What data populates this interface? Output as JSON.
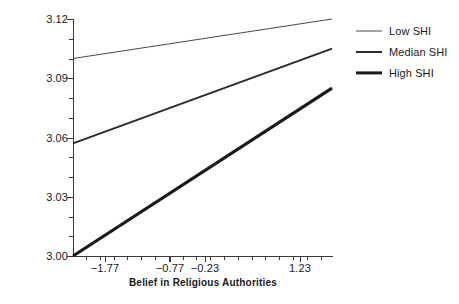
{
  "chart_data": {
    "type": "line",
    "title": "",
    "xlabel": "Belief in Religious Authorities",
    "ylabel": "Happiness",
    "xlim": [
      -2.27,
      1.73
    ],
    "ylim": [
      3.0,
      3.12
    ],
    "grid": false,
    "legend_position": "right",
    "y_ticks": [
      "3.00",
      "3.03",
      "3.06",
      "3.09",
      "3.12"
    ],
    "y_tick_values": [
      3.0,
      3.03,
      3.06,
      3.09,
      3.12
    ],
    "x_ticks": [
      "−1.77",
      "−0.77",
      "−0.23",
      "1.23"
    ],
    "x_tick_values": [
      -1.77,
      -0.77,
      -0.23,
      1.23
    ],
    "series": [
      {
        "name": "Low SHI",
        "line_weight": "thin",
        "color": "#4a4a4a",
        "x": [
          -2.27,
          1.73
        ],
        "values": [
          3.1,
          3.12
        ]
      },
      {
        "name": "Median SHI",
        "line_weight": "medium",
        "color": "#2b2b2b",
        "x": [
          -2.27,
          1.73
        ],
        "values": [
          3.057,
          3.105
        ]
      },
      {
        "name": "High SHI",
        "line_weight": "thick",
        "color": "#1a1a1a",
        "x": [
          -2.27,
          1.73
        ],
        "values": [
          3.0,
          3.085
        ]
      }
    ],
    "legend": [
      "Low SHI",
      "Median SHI",
      "High SHI"
    ]
  }
}
